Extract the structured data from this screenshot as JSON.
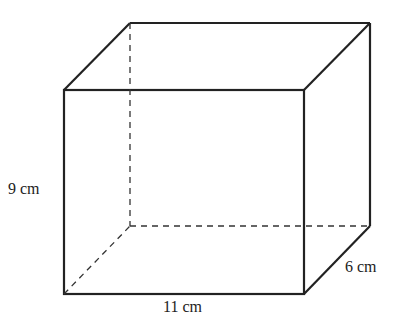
{
  "diagram": {
    "type": "rectangular-prism",
    "colors": {
      "stroke": "#222222",
      "background": "#ffffff"
    },
    "vertices": {
      "front_top_left": [
        64,
        90
      ],
      "front_top_right": [
        304,
        90
      ],
      "front_bottom_left": [
        64,
        294
      ],
      "front_bottom_right": [
        304,
        294
      ],
      "back_top_left": [
        130,
        23
      ],
      "back_top_right": [
        370,
        23
      ],
      "back_bottom_left": [
        130,
        226
      ],
      "back_bottom_right": [
        370,
        226
      ]
    },
    "labels": {
      "height": "9 cm",
      "length": "11 cm",
      "depth": "6 cm"
    }
  }
}
